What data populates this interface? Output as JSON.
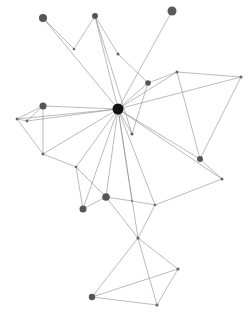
{
  "graph": {
    "type": "network",
    "width": 250,
    "height": 315,
    "background": "#ffffff",
    "edge_color": "#8c8c8c",
    "node_color": "#555555",
    "hub_color": "#111111",
    "nodes": [
      {
        "id": "hub",
        "x": 118,
        "y": 109,
        "r": 5.5,
        "color": "#111111"
      },
      {
        "id": "n1",
        "x": 43,
        "y": 18,
        "r": 4,
        "color": "#555555"
      },
      {
        "id": "n2",
        "x": 95,
        "y": 16,
        "r": 3,
        "color": "#555555"
      },
      {
        "id": "n3",
        "x": 172,
        "y": 11,
        "r": 4.5,
        "color": "#5a5a5a"
      },
      {
        "id": "n4",
        "x": 74,
        "y": 49,
        "r": 1.3,
        "color": "#666666"
      },
      {
        "id": "n5",
        "x": 118,
        "y": 54,
        "r": 1.5,
        "color": "#666666"
      },
      {
        "id": "n6",
        "x": 148,
        "y": 83,
        "r": 2.8,
        "color": "#555555"
      },
      {
        "id": "n7",
        "x": 177,
        "y": 72,
        "r": 1.5,
        "color": "#666666"
      },
      {
        "id": "n8",
        "x": 241,
        "y": 77,
        "r": 1.5,
        "color": "#666666"
      },
      {
        "id": "n9",
        "x": 43,
        "y": 106,
        "r": 3.5,
        "color": "#555555"
      },
      {
        "id": "n10",
        "x": 17,
        "y": 119,
        "r": 1.4,
        "color": "#666666"
      },
      {
        "id": "n11",
        "x": 27,
        "y": 121,
        "r": 1.4,
        "color": "#666666"
      },
      {
        "id": "n12",
        "x": 43,
        "y": 154,
        "r": 1.5,
        "color": "#666666"
      },
      {
        "id": "n13",
        "x": 132,
        "y": 134,
        "r": 1.6,
        "color": "#666666"
      },
      {
        "id": "n14",
        "x": 200,
        "y": 159,
        "r": 3,
        "color": "#555555"
      },
      {
        "id": "n15",
        "x": 222,
        "y": 179,
        "r": 1.5,
        "color": "#666666"
      },
      {
        "id": "n16",
        "x": 76,
        "y": 167,
        "r": 1.3,
        "color": "#666666"
      },
      {
        "id": "n17",
        "x": 106,
        "y": 197,
        "r": 3.8,
        "color": "#555555"
      },
      {
        "id": "n18",
        "x": 83,
        "y": 209,
        "r": 3.5,
        "color": "#555555"
      },
      {
        "id": "n19",
        "x": 132,
        "y": 201,
        "r": 1,
        "color": "#777777"
      },
      {
        "id": "n20",
        "x": 155,
        "y": 205,
        "r": 1.3,
        "color": "#666666"
      },
      {
        "id": "n21",
        "x": 138,
        "y": 238,
        "r": 1.6,
        "color": "#666666"
      },
      {
        "id": "n22",
        "x": 92,
        "y": 297,
        "r": 3.2,
        "color": "#555555"
      },
      {
        "id": "n23",
        "x": 157,
        "y": 305,
        "r": 1.6,
        "color": "#666666"
      },
      {
        "id": "n24",
        "x": 178,
        "y": 269,
        "r": 1.6,
        "color": "#666666"
      }
    ],
    "edges": [
      [
        "n1",
        "n4"
      ],
      [
        "n1",
        "hub"
      ],
      [
        "n4",
        "n2"
      ],
      [
        "n2",
        "n5"
      ],
      [
        "n2",
        "hub"
      ],
      [
        "n2",
        "n13"
      ],
      [
        "n5",
        "n6"
      ],
      [
        "n3",
        "hub"
      ],
      [
        "n6",
        "hub"
      ],
      [
        "n6",
        "n7"
      ],
      [
        "n6",
        "n13"
      ],
      [
        "n7",
        "n8"
      ],
      [
        "n7",
        "n14"
      ],
      [
        "n7",
        "hub"
      ],
      [
        "n8",
        "hub"
      ],
      [
        "n8",
        "n14"
      ],
      [
        "n9",
        "hub"
      ],
      [
        "n9",
        "n10"
      ],
      [
        "n9",
        "n11"
      ],
      [
        "n9",
        "n12"
      ],
      [
        "n10",
        "hub"
      ],
      [
        "n11",
        "hub"
      ],
      [
        "n10",
        "n12"
      ],
      [
        "n10",
        "n11"
      ],
      [
        "n12",
        "hub"
      ],
      [
        "n12",
        "n16"
      ],
      [
        "hub",
        "n14"
      ],
      [
        "hub",
        "n15"
      ],
      [
        "n14",
        "n15"
      ],
      [
        "hub",
        "n13"
      ],
      [
        "hub",
        "n16"
      ],
      [
        "hub",
        "n17"
      ],
      [
        "hub",
        "n18"
      ],
      [
        "hub",
        "n19"
      ],
      [
        "hub",
        "n20"
      ],
      [
        "hub",
        "n21"
      ],
      [
        "n16",
        "n17"
      ],
      [
        "n16",
        "n18"
      ],
      [
        "n18",
        "n17"
      ],
      [
        "n17",
        "n19"
      ],
      [
        "n17",
        "n21"
      ],
      [
        "n19",
        "n20"
      ],
      [
        "n20",
        "n15"
      ],
      [
        "n20",
        "n21"
      ],
      [
        "n21",
        "n22"
      ],
      [
        "n21",
        "n23"
      ],
      [
        "n21",
        "n24"
      ],
      [
        "n22",
        "n24"
      ],
      [
        "n22",
        "n23"
      ],
      [
        "n23",
        "n24"
      ]
    ]
  }
}
